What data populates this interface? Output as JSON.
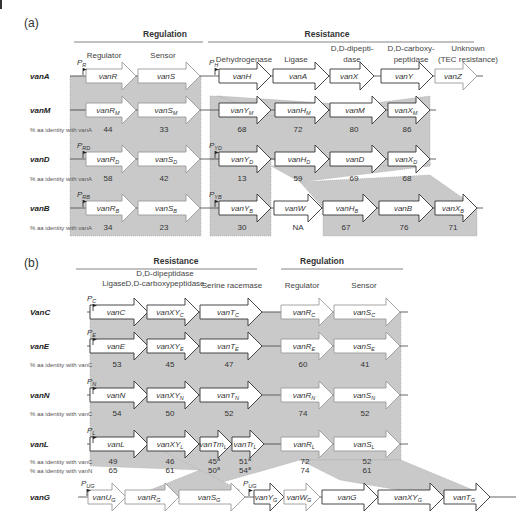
{
  "panel_a": {
    "label": "(a)",
    "section_headers": [
      {
        "text": "Regulation",
        "x": 165,
        "line_x1": 74,
        "line_x2": 203
      },
      {
        "text": "Resistance",
        "x": 327,
        "line_x1": 208,
        "line_x2": 474
      }
    ],
    "function_labels": [
      {
        "text": "Regulator",
        "x": 104,
        "y": 58
      },
      {
        "text": "Sensor",
        "x": 163,
        "y": 58
      },
      {
        "text": "Dehydrogenase",
        "x": 244,
        "y": 62
      },
      {
        "text": "Ligase",
        "x": 296,
        "y": 62
      },
      {
        "text": "D,D-dipepti-",
        "x": 352,
        "y": 51
      },
      {
        "text": "dase",
        "x": 352,
        "y": 62
      },
      {
        "text": "D,D-carboxy-",
        "x": 411,
        "y": 51
      },
      {
        "text": "peptidase",
        "x": 411,
        "y": 62
      },
      {
        "text": "Unknown",
        "x": 468,
        "y": 51
      },
      {
        "text": "(TEC resistance)",
        "x": 468,
        "y": 62
      }
    ],
    "identity_label": "% aa identity with vanA",
    "rows": [
      {
        "name": "vanA",
        "y": 76,
        "promoters": [
          {
            "label": "P",
            "sub": "R",
            "x": 77
          },
          {
            "label": "P",
            "sub": "H",
            "x": 209
          }
        ],
        "genes": [
          {
            "name": "vanR",
            "sub": "",
            "x": 86,
            "w": 50,
            "color": "grey"
          },
          {
            "name": "vanS",
            "sub": "",
            "x": 138,
            "w": 62,
            "color": "grey"
          },
          {
            "name": "vanH",
            "sub": "",
            "x": 219,
            "w": 52,
            "color": "dark"
          },
          {
            "name": "vanA",
            "sub": "",
            "x": 273,
            "w": 56,
            "color": "dark"
          },
          {
            "name": "vanX",
            "sub": "",
            "x": 330,
            "w": 44,
            "color": "dark"
          },
          {
            "name": "vanY",
            "sub": "",
            "x": 381,
            "w": 52,
            "color": "dark"
          },
          {
            "name": "vanZ",
            "sub": "",
            "x": 435,
            "w": 42,
            "color": "grey"
          }
        ],
        "identities": []
      },
      {
        "name": "vanM",
        "y": 110,
        "promoters": [],
        "genes": [
          {
            "name": "vanR",
            "sub": "M",
            "x": 86,
            "w": 50,
            "color": "grey"
          },
          {
            "name": "vanS",
            "sub": "M",
            "x": 138,
            "w": 62,
            "color": "grey"
          },
          {
            "name": "vanY",
            "sub": "M",
            "x": 219,
            "w": 52,
            "color": "dark"
          },
          {
            "name": "vanH",
            "sub": "M",
            "x": 275,
            "w": 54,
            "color": "dark"
          },
          {
            "name": "vanM",
            "sub": "",
            "x": 330,
            "w": 56,
            "color": "dark"
          },
          {
            "name": "vanX",
            "sub": "M",
            "x": 388,
            "w": 42,
            "color": "dark"
          }
        ],
        "identities": [
          {
            "v": "44",
            "x": 108
          },
          {
            "v": "33",
            "x": 164
          },
          {
            "v": "68",
            "x": 242
          },
          {
            "v": "72",
            "x": 298
          },
          {
            "v": "80",
            "x": 354
          },
          {
            "v": "86",
            "x": 407
          }
        ]
      },
      {
        "name": "vanD",
        "y": 159,
        "promoters": [
          {
            "label": "P",
            "sub": "RD",
            "x": 77
          },
          {
            "label": "P",
            "sub": "YD",
            "x": 209
          }
        ],
        "genes": [
          {
            "name": "vanR",
            "sub": "D",
            "x": 86,
            "w": 50,
            "color": "grey"
          },
          {
            "name": "vanS",
            "sub": "D",
            "x": 138,
            "w": 62,
            "color": "grey"
          },
          {
            "name": "vanY",
            "sub": "D",
            "x": 219,
            "w": 52,
            "color": "dark"
          },
          {
            "name": "vanH",
            "sub": "D",
            "x": 275,
            "w": 54,
            "color": "dark"
          },
          {
            "name": "vanD",
            "sub": "",
            "x": 330,
            "w": 56,
            "color": "dark"
          },
          {
            "name": "vanX",
            "sub": "D",
            "x": 388,
            "w": 42,
            "color": "dark"
          }
        ],
        "identities": [
          {
            "v": "58",
            "x": 108
          },
          {
            "v": "42",
            "x": 164
          },
          {
            "v": "13",
            "x": 242
          },
          {
            "v": "59",
            "x": 298
          },
          {
            "v": "69",
            "x": 354
          },
          {
            "v": "68",
            "x": 407
          }
        ]
      },
      {
        "name": "vanB",
        "y": 208,
        "promoters": [
          {
            "label": "P",
            "sub": "RB",
            "x": 77
          },
          {
            "label": "P",
            "sub": "YB",
            "x": 209
          }
        ],
        "genes": [
          {
            "name": "vanR",
            "sub": "B",
            "x": 86,
            "w": 50,
            "color": "grey"
          },
          {
            "name": "vanS",
            "sub": "B",
            "x": 138,
            "w": 62,
            "color": "grey"
          },
          {
            "name": "vanY",
            "sub": "B",
            "x": 219,
            "w": 52,
            "color": "dark"
          },
          {
            "name": "vanW",
            "sub": "",
            "x": 274,
            "w": 48,
            "color": "dark"
          },
          {
            "name": "vanH",
            "sub": "B",
            "x": 323,
            "w": 54,
            "color": "dark"
          },
          {
            "name": "vanB",
            "sub": "",
            "x": 379,
            "w": 54,
            "color": "dark"
          },
          {
            "name": "vanX",
            "sub": "B",
            "x": 435,
            "w": 42,
            "color": "dark"
          }
        ],
        "identities": [
          {
            "v": "34",
            "x": 108
          },
          {
            "v": "23",
            "x": 164
          },
          {
            "v": "30",
            "x": 242
          },
          {
            "v": "NA",
            "x": 298
          },
          {
            "v": "67",
            "x": 346
          },
          {
            "v": "76",
            "x": 404
          },
          {
            "v": "71",
            "x": 453
          }
        ]
      }
    ]
  },
  "panel_b": {
    "label": "(b)",
    "section_headers": [
      {
        "text": "Resistance",
        "x": 176,
        "line_x1": 76,
        "line_x2": 257
      },
      {
        "text": "Regulation",
        "x": 322,
        "line_x1": 281,
        "line_x2": 403
      }
    ],
    "function_labels": [
      {
        "text": "Ligase",
        "x": 114,
        "y": 286
      },
      {
        "text": "D,D-dipeptidase",
        "x": 165,
        "y": 276
      },
      {
        "text": "D,D-carboxypeptidase",
        "x": 165,
        "y": 286
      },
      {
        "text": "Serine racemase",
        "x": 232,
        "y": 288
      },
      {
        "text": "Regulator",
        "x": 302,
        "y": 288
      },
      {
        "text": "Sensor",
        "x": 364,
        "y": 288
      }
    ],
    "identity_label_c": "% aa identity with vanC",
    "identity_label_n": "% aa identity with vanN",
    "rows": [
      {
        "name": "VanC",
        "y": 312,
        "promoter": {
          "label": "P",
          "sub": "C",
          "x": 87
        },
        "genes": [
          {
            "name": "vanC",
            "sub": "",
            "x": 90,
            "w": 58,
            "color": "dark"
          },
          {
            "name": "vanXY",
            "sub": "C",
            "x": 147,
            "w": 52,
            "color": "dark"
          },
          {
            "name": "vanT",
            "sub": "C",
            "x": 200,
            "w": 62,
            "color": "dark"
          },
          {
            "name": "vanR",
            "sub": "C",
            "x": 281,
            "w": 52,
            "color": "grey"
          },
          {
            "name": "vanS",
            "sub": "C",
            "x": 334,
            "w": 66,
            "color": "grey"
          }
        ],
        "identities": []
      },
      {
        "name": "vanE",
        "y": 346,
        "promoter": {
          "label": "P",
          "sub": "E",
          "x": 87
        },
        "genes": [
          {
            "name": "vanE",
            "sub": "",
            "x": 90,
            "w": 58,
            "color": "dark"
          },
          {
            "name": "vanXY",
            "sub": "E",
            "x": 147,
            "w": 52,
            "color": "dark"
          },
          {
            "name": "vanT",
            "sub": "E",
            "x": 200,
            "w": 62,
            "color": "dark"
          },
          {
            "name": "vanR",
            "sub": "E",
            "x": 281,
            "w": 52,
            "color": "grey"
          },
          {
            "name": "vanS",
            "sub": "E",
            "x": 334,
            "w": 66,
            "color": "grey"
          }
        ],
        "identities": [
          {
            "v": "53",
            "x": 117
          },
          {
            "v": "45",
            "x": 170
          },
          {
            "v": "47",
            "x": 229
          },
          {
            "v": "60",
            "x": 303
          },
          {
            "v": "41",
            "x": 365
          }
        ]
      },
      {
        "name": "vanN",
        "y": 395,
        "promoter": {
          "label": "P",
          "sub": "N",
          "x": 87
        },
        "genes": [
          {
            "name": "vanN",
            "sub": "",
            "x": 90,
            "w": 58,
            "color": "dark"
          },
          {
            "name": "vanXY",
            "sub": "N",
            "x": 147,
            "w": 52,
            "color": "dark"
          },
          {
            "name": "vanT",
            "sub": "N",
            "x": 200,
            "w": 62,
            "color": "dark"
          },
          {
            "name": "vanR",
            "sub": "N",
            "x": 281,
            "w": 52,
            "color": "grey"
          },
          {
            "name": "vanS",
            "sub": "N",
            "x": 334,
            "w": 66,
            "color": "grey"
          }
        ],
        "identities": [
          {
            "v": "54",
            "x": 117
          },
          {
            "v": "50",
            "x": 170
          },
          {
            "v": "52",
            "x": 229
          },
          {
            "v": "74",
            "x": 303
          },
          {
            "v": "52",
            "x": 365
          }
        ]
      },
      {
        "name": "vanL",
        "y": 444,
        "promoter": {
          "label": "P",
          "sub": "L",
          "x": 87
        },
        "genes": [
          {
            "name": "vanL",
            "sub": "",
            "x": 90,
            "w": 58,
            "color": "dark"
          },
          {
            "name": "vanXY",
            "sub": "L",
            "x": 147,
            "w": 52,
            "color": "dark"
          },
          {
            "name": "vanTm",
            "sub": "L",
            "x": 200,
            "w": 32,
            "color": "dark"
          },
          {
            "name": "vanTr",
            "sub": "L",
            "x": 232,
            "w": 32,
            "color": "dark"
          },
          {
            "name": "vanR",
            "sub": "L",
            "x": 281,
            "w": 52,
            "color": "grey"
          },
          {
            "name": "vanS",
            "sub": "L",
            "x": 334,
            "w": 66,
            "color": "grey"
          }
        ],
        "identities_c": [
          {
            "v": "49",
            "x": 113
          },
          {
            "v": "46",
            "x": 170
          },
          {
            "v": "45",
            "x": 214,
            "sup": "a"
          },
          {
            "v": "51",
            "x": 245,
            "sup": "a"
          },
          {
            "v": "72",
            "x": 305
          },
          {
            "v": "52",
            "x": 367
          }
        ],
        "identities_n": [
          {
            "v": "65",
            "x": 113
          },
          {
            "v": "61",
            "x": 170
          },
          {
            "v": "50",
            "x": 214,
            "sup": "a"
          },
          {
            "v": "54",
            "x": 245,
            "sup": "a"
          },
          {
            "v": "74",
            "x": 305
          },
          {
            "v": "61",
            "x": 367
          }
        ]
      },
      {
        "name": "vanG",
        "y": 497,
        "promoters": [
          {
            "label": "P",
            "sub": "UG",
            "x": 81
          },
          {
            "label": "P",
            "sub": "UG",
            "x": 243
          }
        ],
        "genes": [
          {
            "name": "vanU",
            "sub": "G",
            "x": 88,
            "w": 38,
            "color": "grey"
          },
          {
            "name": "vanR",
            "sub": "G",
            "x": 125,
            "w": 54,
            "color": "grey"
          },
          {
            "name": "vanS",
            "sub": "G",
            "x": 179,
            "w": 66,
            "color": "grey"
          },
          {
            "name": "vanY",
            "sub": "G",
            "x": 254,
            "w": 30,
            "color": "dark"
          },
          {
            "name": "vanW",
            "sub": "G",
            "x": 284,
            "w": 36,
            "color": "grey"
          },
          {
            "name": "vanG",
            "sub": "",
            "x": 322,
            "w": 56,
            "color": "dark"
          },
          {
            "name": "vanXY",
            "sub": "G",
            "x": 378,
            "w": 66,
            "color": "dark"
          },
          {
            "name": "vanT",
            "sub": "G",
            "x": 444,
            "w": 46,
            "color": "dark"
          }
        ]
      }
    ]
  },
  "colors": {
    "shade": "#c9c9c9",
    "dark_outline": "#333333",
    "grey_outline": "#9a9a9a",
    "grey_text": "#999999",
    "dark_text": "#333333"
  }
}
